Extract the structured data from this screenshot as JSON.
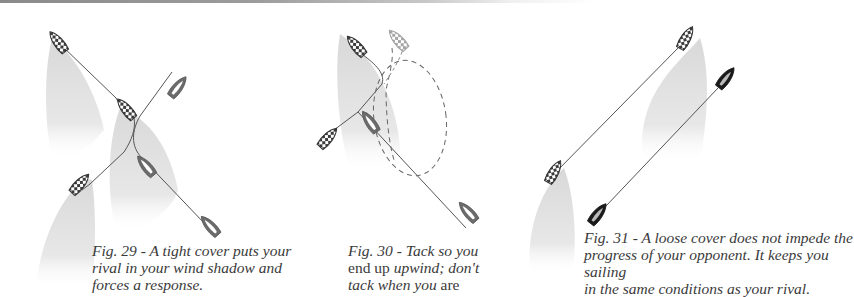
{
  "figures": [
    {
      "id": "fig29",
      "number": "Fig. 29",
      "caption": "Fig. 29 - A tight cover puts your rival in your wind shadow and forces a response.",
      "caption_lines": [
        "Fig. 29 - A tight cover puts your",
        "rival in your wind shadow and",
        "forces a response."
      ]
    },
    {
      "id": "fig30",
      "number": "Fig. 30",
      "caption_lines": [
        {
          "parts": [
            {
              "text": "Fig. 30 - Tack so you",
              "italic": true
            }
          ]
        },
        {
          "parts": [
            {
              "text": "end up ",
              "italic": false
            },
            {
              "text": "upwind; don't",
              "italic": true
            }
          ]
        },
        {
          "parts": [
            {
              "text": "tack when you",
              "italic": true
            },
            {
              "text": " are",
              "italic": false
            }
          ]
        }
      ],
      "line1": "Fig. 30 - Tack so you",
      "line2a": "end up ",
      "line2b": "upwind; don't",
      "line3a": "tack when you",
      "line3b": " are"
    },
    {
      "id": "fig31",
      "number": "Fig. 31",
      "caption_lines": [
        "Fig. 31 - A loose cover does not impede the",
        "progress of your opponent. It keeps you sailing",
        "in the same conditions as your rival."
      ]
    }
  ],
  "colors": {
    "shadow": "#d9d9d9",
    "rival_boat": "#6b6b6b",
    "checkered_boat": "#3c3c3c",
    "dark_boat": "#1a1a1a",
    "track_line": "#555555",
    "caption_text": "#3a3a3a"
  },
  "icons": {
    "checkered_boat": "checkered-boat-icon",
    "grey_boat": "grey-boat-icon",
    "black_boat": "black-boat-icon",
    "wind_shadow": "wind-shadow-shape"
  }
}
